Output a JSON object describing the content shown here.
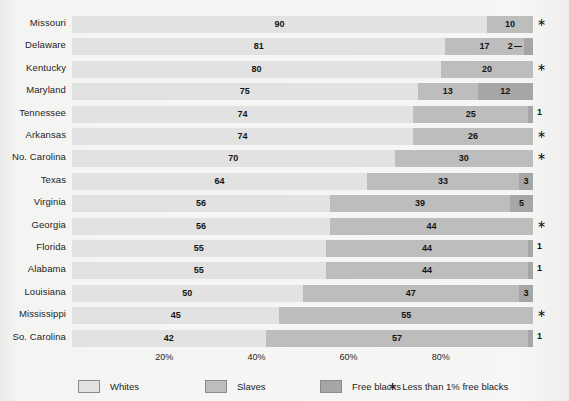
{
  "chart_data": {
    "type": "bar",
    "orientation": "horizontal",
    "stacked": true,
    "normalized_percent": true,
    "title": "",
    "subtitle": "",
    "xlabel": "",
    "ylabel": "",
    "xlim": [
      0,
      100
    ],
    "grid": false,
    "legend_position": "bottom",
    "categories": [
      "Missouri",
      "Delaware",
      "Kentucky",
      "Maryland",
      "Tennessee",
      "Arkansas",
      "No. Carolina",
      "Texas",
      "Virginia",
      "Georgia",
      "Florida",
      "Alabama",
      "Louisiana",
      "Mississippi",
      "So. Carolina"
    ],
    "series": [
      {
        "name": "Whites",
        "color": "#e2e2e2",
        "values": [
          90,
          81,
          80,
          75,
          74,
          74,
          70,
          64,
          56,
          56,
          55,
          55,
          50,
          45,
          42
        ]
      },
      {
        "name": "Slaves",
        "color": "#bdbdbd",
        "values": [
          10,
          17,
          20,
          13,
          25,
          26,
          30,
          33,
          39,
          44,
          44,
          44,
          47,
          55,
          57
        ]
      },
      {
        "name": "Free blacks",
        "color": "#a6a6a6",
        "values": [
          0,
          2,
          0,
          12,
          1,
          0,
          0,
          3,
          5,
          0,
          1,
          1,
          3,
          0,
          1
        ]
      }
    ],
    "xticks": [
      20,
      40,
      60,
      80
    ],
    "xticklabels": [
      "20%",
      "40%",
      "60%",
      "80%"
    ],
    "annotations": {
      "asterisk_means": "Less than 1% free blacks",
      "asterisk_glyph": "∗"
    }
  },
  "rows": [
    {
      "label": "Missouri",
      "whites": 90,
      "slaves": 10,
      "free": 0,
      "free_label": "",
      "note": "∗",
      "note_is_star": true,
      "callout": false
    },
    {
      "label": "Delaware",
      "whites": 81,
      "slaves": 17,
      "free": 2,
      "free_label": "2",
      "note": "",
      "note_is_star": false,
      "callout": true
    },
    {
      "label": "Kentucky",
      "whites": 80,
      "slaves": 20,
      "free": 0,
      "free_label": "",
      "note": "∗",
      "note_is_star": true,
      "callout": false
    },
    {
      "label": "Maryland",
      "whites": 75,
      "slaves": 13,
      "free": 12,
      "free_label": "12",
      "note": "",
      "note_is_star": false,
      "callout": false
    },
    {
      "label": "Tennessee",
      "whites": 74,
      "slaves": 25,
      "free": 1,
      "free_label": "",
      "note": "1",
      "note_is_star": false,
      "callout": false
    },
    {
      "label": "Arkansas",
      "whites": 74,
      "slaves": 26,
      "free": 0,
      "free_label": "",
      "note": "∗",
      "note_is_star": true,
      "callout": false
    },
    {
      "label": "No. Carolina",
      "whites": 70,
      "slaves": 30,
      "free": 0,
      "free_label": "",
      "note": "∗",
      "note_is_star": true,
      "callout": false
    },
    {
      "label": "Texas",
      "whites": 64,
      "slaves": 33,
      "free": 3,
      "free_label": "3",
      "note": "",
      "note_is_star": false,
      "callout": false
    },
    {
      "label": "Virginia",
      "whites": 56,
      "slaves": 39,
      "free": 5,
      "free_label": "5",
      "note": "",
      "note_is_star": false,
      "callout": false
    },
    {
      "label": "Georgia",
      "whites": 56,
      "slaves": 44,
      "free": 0,
      "free_label": "",
      "note": "∗",
      "note_is_star": true,
      "callout": false
    },
    {
      "label": "Florida",
      "whites": 55,
      "slaves": 44,
      "free": 1,
      "free_label": "",
      "note": "1",
      "note_is_star": false,
      "callout": false
    },
    {
      "label": "Alabama",
      "whites": 55,
      "slaves": 44,
      "free": 1,
      "free_label": "",
      "note": "1",
      "note_is_star": false,
      "callout": false
    },
    {
      "label": "Louisiana",
      "whites": 50,
      "slaves": 47,
      "free": 3,
      "free_label": "3",
      "note": "",
      "note_is_star": false,
      "callout": false
    },
    {
      "label": "Mississippi",
      "whites": 45,
      "slaves": 55,
      "free": 0,
      "free_label": "",
      "note": "∗",
      "note_is_star": true,
      "callout": false
    },
    {
      "label": "So. Carolina",
      "whites": 42,
      "slaves": 57,
      "free": 1,
      "free_label": "",
      "note": "1",
      "note_is_star": false,
      "callout": false
    }
  ],
  "axis": {
    "ticks": [
      {
        "label": "20%",
        "value": 20
      },
      {
        "label": "40%",
        "value": 40
      },
      {
        "label": "60%",
        "value": 60
      },
      {
        "label": "80%",
        "value": 80
      }
    ]
  },
  "legend": {
    "items": [
      {
        "label": "Whites",
        "swatch_class": "sw-whites",
        "color": "#e2e2e2",
        "left": 78
      },
      {
        "label": "Slaves",
        "swatch_class": "sw-slaves",
        "color": "#bdbdbd",
        "left": 205
      },
      {
        "label": "Free blacks",
        "swatch_class": "sw-free",
        "color": "#a6a6a6",
        "left": 320
      }
    ],
    "note_star": "∗",
    "note_text": "Less than 1% free blacks"
  }
}
